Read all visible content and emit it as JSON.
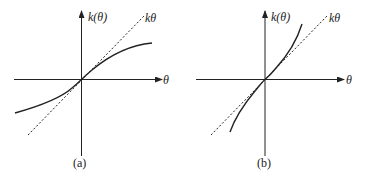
{
  "panels": [
    {
      "id": "a",
      "caption": "(a)",
      "y_axis_label": "k(θ)",
      "x_axis_label": "θ",
      "reference_line_label": "kθ",
      "curve_type": "sublinear (saturating) below kθ for θ>0"
    },
    {
      "id": "b",
      "caption": "(b)",
      "y_axis_label": "k(θ)",
      "x_axis_label": "θ",
      "reference_line_label": "kθ",
      "curve_type": "superlinear (stiffening) above kθ for θ>0"
    }
  ],
  "colors": {
    "ink": "#222222",
    "background": "#ffffff"
  }
}
